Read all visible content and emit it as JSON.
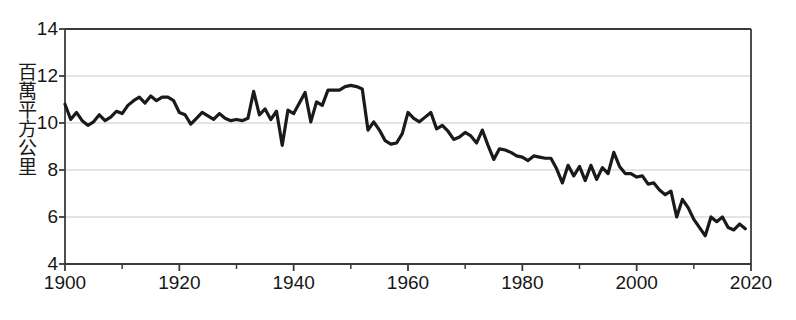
{
  "chart_data": {
    "type": "line",
    "title": "",
    "xlabel": "",
    "ylabel": "百萬平方公里",
    "xlim": [
      1900,
      2020
    ],
    "ylim": [
      4,
      14
    ],
    "xticks": [
      1900,
      1920,
      1940,
      1960,
      1980,
      2000,
      2020
    ],
    "xtick_labels": [
      "1900",
      "1920",
      "1940",
      "1960",
      "1980",
      "2000",
      "2020"
    ],
    "xminor_ticks": [
      1910,
      1930,
      1950,
      1970,
      1990,
      2010
    ],
    "yticks": [
      4,
      6,
      8,
      10,
      12,
      14
    ],
    "ytick_labels": [
      "4",
      "6",
      "8",
      "10",
      "12",
      "14"
    ],
    "grid": "horizontal",
    "legend": "none",
    "line_color": "#1a1a1a",
    "line_width": 3.2,
    "grid_color": "#c9c9c9",
    "axis_color": "#3a3a3a",
    "background": "#ffffff",
    "x": [
      1900,
      1901,
      1902,
      1903,
      1904,
      1905,
      1906,
      1907,
      1908,
      1909,
      1910,
      1911,
      1912,
      1913,
      1914,
      1915,
      1916,
      1917,
      1918,
      1919,
      1920,
      1921,
      1922,
      1923,
      1924,
      1925,
      1926,
      1927,
      1928,
      1929,
      1930,
      1931,
      1932,
      1933,
      1934,
      1935,
      1936,
      1937,
      1938,
      1939,
      1940,
      1941,
      1942,
      1943,
      1944,
      1945,
      1946,
      1947,
      1948,
      1949,
      1950,
      1951,
      1952,
      1953,
      1954,
      1955,
      1956,
      1957,
      1958,
      1959,
      1960,
      1961,
      1962,
      1963,
      1964,
      1965,
      1966,
      1967,
      1968,
      1969,
      1970,
      1971,
      1972,
      1973,
      1974,
      1975,
      1976,
      1977,
      1978,
      1979,
      1980,
      1981,
      1982,
      1983,
      1984,
      1985,
      1986,
      1987,
      1988,
      1989,
      1990,
      1991,
      1992,
      1993,
      1994,
      1995,
      1996,
      1997,
      1998,
      1999,
      2000,
      2001,
      2002,
      2003,
      2004,
      2005,
      2006,
      2007,
      2008,
      2009,
      2010,
      2011,
      2012,
      2013,
      2014,
      2015,
      2016,
      2017,
      2018,
      2019
    ],
    "values": [
      10.8,
      10.15,
      10.45,
      10.1,
      9.9,
      10.05,
      10.35,
      10.1,
      10.25,
      10.5,
      10.4,
      10.75,
      10.95,
      11.1,
      10.85,
      11.15,
      10.95,
      11.1,
      11.1,
      10.95,
      10.45,
      10.35,
      9.95,
      10.2,
      10.45,
      10.3,
      10.15,
      10.4,
      10.2,
      10.1,
      10.15,
      10.1,
      10.2,
      11.35,
      10.35,
      10.6,
      10.15,
      10.5,
      9.05,
      10.55,
      10.4,
      10.85,
      11.3,
      10.05,
      10.9,
      10.75,
      11.4,
      11.4,
      11.4,
      11.55,
      11.6,
      11.55,
      11.45,
      9.7,
      10.05,
      9.7,
      9.25,
      9.1,
      9.15,
      9.55,
      10.45,
      10.2,
      10.05,
      10.25,
      10.45,
      9.75,
      9.9,
      9.65,
      9.3,
      9.4,
      9.6,
      9.45,
      9.15,
      9.7,
      9.05,
      8.45,
      8.9,
      8.85,
      8.75,
      8.6,
      8.55,
      8.4,
      8.6,
      8.55,
      8.5,
      8.5,
      8.05,
      7.45,
      8.2,
      7.75,
      8.15,
      7.55,
      8.2,
      7.6,
      8.1,
      7.85,
      8.75,
      8.15,
      7.85,
      7.85,
      7.7,
      7.75,
      7.4,
      7.45,
      7.15,
      6.95,
      7.1,
      6.0,
      6.75,
      6.4,
      5.9,
      5.55,
      5.2,
      6.0,
      5.8,
      6.0,
      5.55,
      5.45,
      5.7,
      5.5
    ]
  },
  "axis": {
    "ylabel_text": "百萬平方公里"
  }
}
